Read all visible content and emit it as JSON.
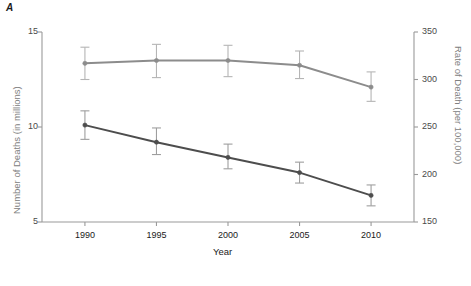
{
  "panel": {
    "label": "A"
  },
  "chart_data": {
    "type": "line",
    "title": "",
    "xlabel": "Year",
    "ylabel": "Number of Deaths (in millions)",
    "y2label": "Rate of Death (per 100,000)",
    "categories": [
      "1990",
      "1995",
      "2000",
      "2005",
      "2010"
    ],
    "x": [
      1990,
      1995,
      2000,
      2005,
      2010
    ],
    "xlim": [
      1987,
      2013
    ],
    "ylim": [
      5,
      15
    ],
    "y2lim": [
      150,
      350
    ],
    "yticks": [
      "5",
      "10",
      "15"
    ],
    "ytick_values": [
      5,
      10,
      15
    ],
    "y2ticks": [
      "150",
      "200",
      "250",
      "300",
      "350"
    ],
    "y2tick_values": [
      150,
      200,
      250,
      300,
      350
    ],
    "grid": false,
    "legend": "none",
    "series": [
      {
        "name": "Rate of Death (per 100,000)",
        "axis": "right",
        "color": "#8c8c8c",
        "values": [
          317,
          320,
          320,
          315,
          292
        ],
        "err_low": [
          300,
          302,
          303,
          301,
          277
        ],
        "err_high": [
          334,
          337,
          336,
          330,
          308
        ],
        "marker": "circle"
      },
      {
        "name": "Number of Deaths (in millions)",
        "axis": "left",
        "color": "#4d4d4d",
        "values": [
          10.1,
          9.2,
          8.4,
          7.6,
          6.4
        ],
        "err_low": [
          9.35,
          8.55,
          7.8,
          7.05,
          5.85
        ],
        "err_high": [
          10.85,
          9.95,
          9.1,
          8.15,
          6.95
        ],
        "marker": "circle"
      }
    ]
  }
}
